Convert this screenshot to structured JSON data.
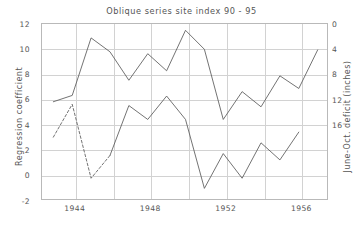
{
  "chart_data": {
    "type": "line",
    "title": "Oblique series site index 90 - 95",
    "xlabel": "",
    "ylabel": "Regression coefficient",
    "ylabel_right": "June-Oct. deficit (inches)",
    "xlim": [
      1942.4,
      1957.6
    ],
    "ylim": [
      -2,
      12
    ],
    "ylim_right": [
      18,
      0
    ],
    "grid": true,
    "legend": "none",
    "xticks": [
      1944,
      1948,
      1952,
      1956
    ],
    "xtick_labels": [
      "1944",
      "1948",
      "1952",
      "1956"
    ],
    "xgridlines": [
      1944,
      1946,
      1948,
      1950,
      1952,
      1954,
      1956
    ],
    "yticks": [
      -2,
      0,
      2,
      4,
      6,
      8,
      10,
      12
    ],
    "ytick_labels": [
      "-2",
      "0",
      "2",
      "4",
      "6",
      "8",
      "10",
      "12"
    ],
    "yticks_right": [
      0,
      4,
      8,
      12,
      16
    ],
    "ytick_labels_right": [
      "0",
      "4",
      "8",
      "12",
      "16"
    ],
    "x": [
      1943,
      1944,
      1945,
      1946,
      1947,
      1948,
      1949,
      1950,
      1951,
      1952,
      1953,
      1954,
      1955,
      1956,
      1957
    ],
    "series": [
      {
        "name": "Regression coefficient",
        "axis": "left",
        "linestyle": "solid",
        "color": "#5a5a5a",
        "values": [
          5.85,
          6.35,
          10.9,
          9.8,
          7.55,
          9.65,
          8.3,
          11.5,
          10.0,
          4.45,
          6.65,
          5.45,
          7.9,
          6.9,
          9.95
        ]
      },
      {
        "name": "June-Oct. deficit (inches)",
        "axis": "right",
        "linestyle": "dashed-then-solid",
        "dashed_span": [
          1943,
          1946
        ],
        "color": "#5a5a5a",
        "values": [
          3.05,
          5.65,
          -0.2,
          1.6,
          5.55,
          4.45,
          6.3,
          4.45,
          -1.0,
          1.75,
          -0.2,
          2.6,
          1.25,
          3.45,
          null
        ]
      }
    ]
  }
}
